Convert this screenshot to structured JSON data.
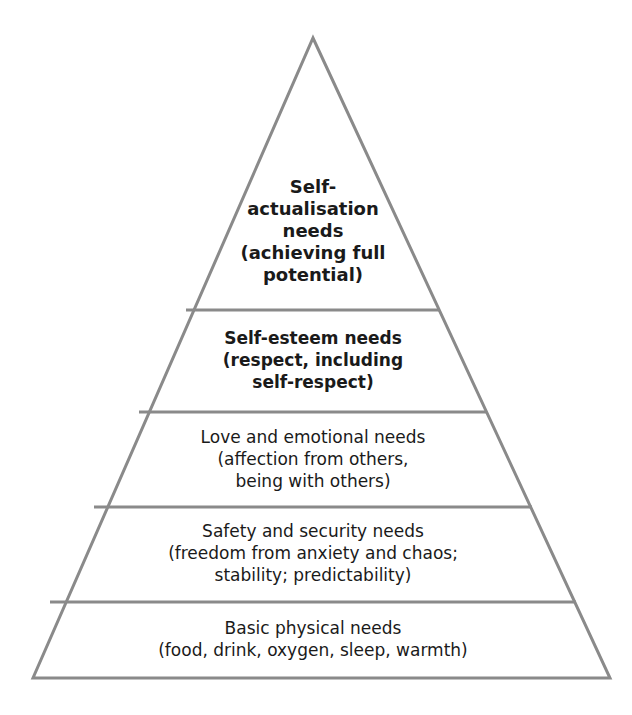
{
  "diagram": {
    "type": "pyramid",
    "colors": {
      "outline": "#8a8a8a",
      "fill": "#ffffff",
      "text": "#1a1a1a"
    },
    "tiers": [
      {
        "id": "self-actualisation",
        "lines": [
          "Self-",
          "actualisation",
          "needs",
          "(achieving full",
          "potential)"
        ]
      },
      {
        "id": "self-esteem",
        "lines": [
          "Self-esteem needs",
          "(respect, including",
          "self-respect)"
        ]
      },
      {
        "id": "love-emotional",
        "lines": [
          "Love and emotional needs",
          "(affection from others,",
          "being with others)"
        ]
      },
      {
        "id": "safety-security",
        "lines": [
          "Safety and security needs",
          "(freedom from anxiety and chaos;",
          "stability; predictability)"
        ]
      },
      {
        "id": "basic-physical",
        "lines": [
          "Basic physical needs",
          "(food, drink, oxygen, sleep, warmth)"
        ]
      }
    ]
  }
}
